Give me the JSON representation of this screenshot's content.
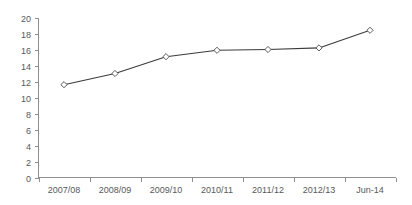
{
  "chart_data": {
    "type": "line",
    "title": "",
    "subtitle": "",
    "xlabel": "",
    "ylabel": "",
    "categories": [
      "2007/08",
      "2008/09",
      "2009/10",
      "2010/11",
      "2011/12",
      "2012/13",
      "Jun-14"
    ],
    "values": [
      11.6,
      13.0,
      15.1,
      15.9,
      16.0,
      16.2,
      18.4
    ],
    "series": [
      {
        "name": "",
        "values": [
          11.6,
          13.0,
          15.1,
          15.9,
          16.0,
          16.2,
          18.4
        ]
      }
    ],
    "ylim": [
      0,
      20
    ],
    "ytick_values": [
      0,
      2,
      4,
      6,
      8,
      10,
      12,
      14,
      16,
      18,
      20
    ],
    "ytick_labels": [
      "0",
      "2",
      "4",
      "6",
      "8",
      "10",
      "12",
      "14",
      "16",
      "18",
      "20"
    ],
    "grid": false,
    "legend": false,
    "legend_position": "none",
    "marker": "diamond",
    "colors": {
      "line": "#3b3b3d",
      "marker_fill": "#ffffff",
      "marker_stroke": "#4a4a4c",
      "axis": "#8d8f91",
      "tick_text": "#58595b",
      "background": "#ffffff"
    }
  }
}
